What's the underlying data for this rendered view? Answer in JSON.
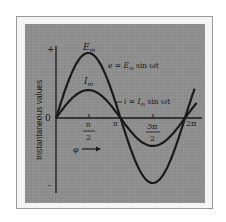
{
  "chart_data": {
    "type": "line",
    "title": "",
    "xlabel": "φ",
    "ylabel": "Instantaneous values",
    "x_tick_labels": [
      "0",
      "π/2",
      "π",
      "3π/2",
      "2π"
    ],
    "x_ticks": [
      0,
      1.5708,
      3.1416,
      4.7124,
      6.2832
    ],
    "y_tick_labels": [
      "+",
      "0",
      "-"
    ],
    "xlim": [
      0,
      6.8
    ],
    "ylim": [
      -1,
      1
    ],
    "grid": false,
    "series": [
      {
        "name": "e = E_m sin ωt",
        "peak_label": "E_m",
        "amplitude": 1.0,
        "function": "sin",
        "x": [
          0,
          0.785,
          1.571,
          2.356,
          3.142,
          3.927,
          4.712,
          5.498,
          6.283,
          6.8
        ],
        "values": [
          0,
          0.71,
          1.0,
          0.71,
          0,
          -0.71,
          -1.0,
          -0.71,
          0,
          0.48
        ]
      },
      {
        "name": "i = I_m sin ωt",
        "peak_label": "I_m",
        "amplitude": 0.43,
        "function": "sin",
        "x": [
          0,
          0.785,
          1.571,
          2.356,
          3.142,
          3.927,
          4.712,
          5.498,
          6.283,
          6.8
        ],
        "values": [
          0,
          0.3,
          0.43,
          0.3,
          0,
          -0.3,
          -0.43,
          -0.3,
          0,
          0.21
        ]
      }
    ],
    "annotations": [
      "E_m",
      "I_m",
      "e = E_m sin ωt",
      "i = I_m sin ωt",
      "φ →"
    ]
  },
  "labels": {
    "plus": "+",
    "minus": "-",
    "zero": "0",
    "y_axis": "Instantaneous values",
    "pi_half_num": "π",
    "pi_half_den": "2",
    "pi": "π",
    "three_pi_half_num": "3π",
    "three_pi_half_den": "2",
    "two_pi": "2π",
    "phi": "φ",
    "em_peak": "E",
    "em_sub": "m",
    "im_peak": "I",
    "im_sub": "m",
    "e_eq_pre": "e = E",
    "e_eq_sub": "m",
    "e_eq_post": " sin ωt",
    "i_eq_pre": "i = I",
    "i_eq_sub": "m",
    "i_eq_post": " sin ωt"
  }
}
